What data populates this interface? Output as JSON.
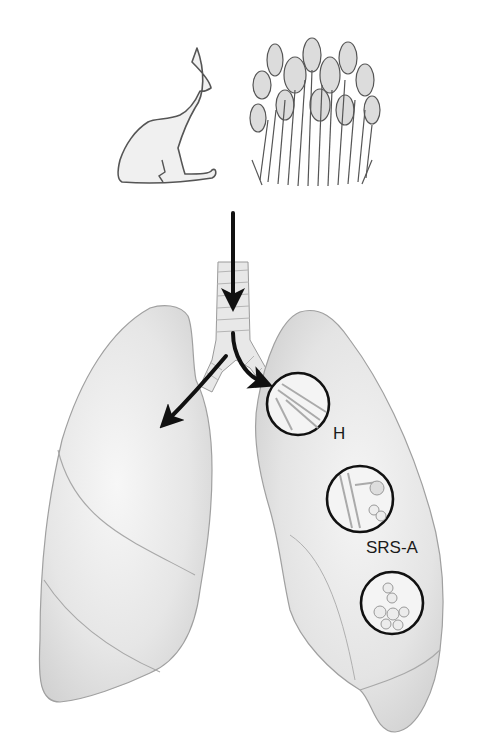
{
  "diagram": {
    "allergens": [
      {
        "name": "cat",
        "icon": "cat-icon"
      },
      {
        "name": "ragweed plant",
        "icon": "plant-icon"
      }
    ],
    "labels": {
      "histamine": "H",
      "srs_a": "SRS-A"
    },
    "magnified_views": [
      {
        "name": "bronchus-detail",
        "label": "H"
      },
      {
        "name": "bronchiole-detail",
        "label": "SRS-A"
      },
      {
        "name": "alveoli-detail",
        "label": ""
      }
    ],
    "colors": {
      "outline": "#8a8a8a",
      "lung_fill": "#efefef",
      "lung_shade": "#c8c8c8",
      "arrow": "#111111",
      "circle": "#111111",
      "text": "#1a1a1a"
    }
  }
}
